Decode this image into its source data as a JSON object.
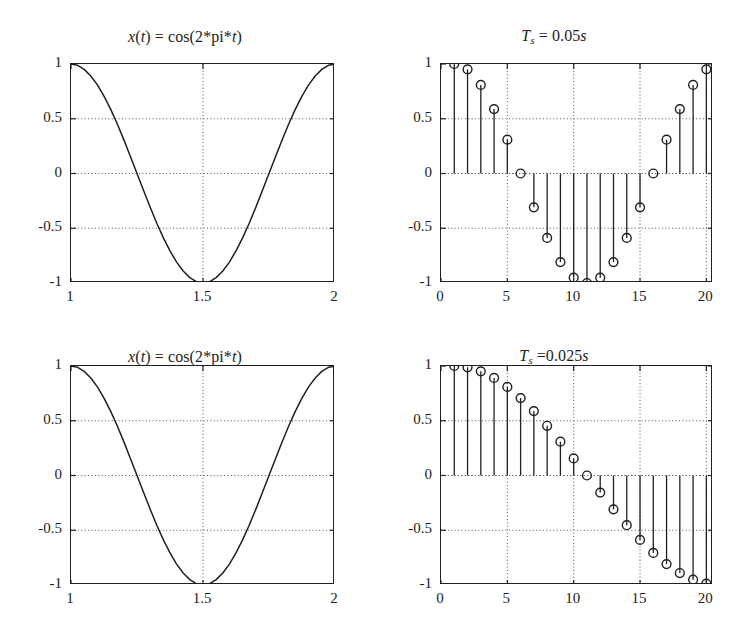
{
  "figure": {
    "background": "#ffffff",
    "ink": "#202020",
    "grid_color": "#555555",
    "panel_count": 4
  },
  "panels": [
    {
      "id": "top-left",
      "title_prefix": "x",
      "title_arg": "(t)",
      "title_rest": " = cos(2*pi*",
      "title_var": "t",
      "title_close": ")",
      "title_plain": "x(t) = cos(2*pi*t)"
    },
    {
      "id": "top-right",
      "title_main": "T",
      "title_sub": "s",
      "title_rest": " = 0.05",
      "title_unit": "s",
      "title_plain": "Ts = 0.05s"
    },
    {
      "id": "bottom-left",
      "title_plain": "x(t) = cos(2*pi*t)"
    },
    {
      "id": "bottom-right",
      "title_main": "T",
      "title_sub": "s",
      "title_rest": " =0.025",
      "title_unit": "s",
      "title_plain": "Ts =0.025s"
    }
  ],
  "chart_data": [
    {
      "panel": "top-left",
      "type": "line",
      "title": "x(t) = cos(2*pi*t)",
      "xlabel": "",
      "ylabel": "",
      "xlim": [
        1,
        2
      ],
      "ylim": [
        -1,
        1
      ],
      "xticks": [
        1,
        1.5,
        2
      ],
      "xticklabels": [
        "1",
        "1.5",
        "2"
      ],
      "yticks": [
        -1,
        -0.5,
        0,
        0.5,
        1
      ],
      "yticklabels": [
        "-1",
        "-0.5",
        "0",
        "0.5",
        "1"
      ],
      "grid": true,
      "grid_style": "dotted",
      "legend": "none",
      "series": [
        {
          "name": "cos(2*pi*t)",
          "formula": "cos(2*pi*t)",
          "x": [
            1,
            1.025,
            1.05,
            1.075,
            1.1,
            1.125,
            1.15,
            1.175,
            1.2,
            1.225,
            1.25,
            1.275,
            1.3,
            1.325,
            1.35,
            1.375,
            1.4,
            1.425,
            1.45,
            1.475,
            1.5,
            1.525,
            1.55,
            1.575,
            1.6,
            1.625,
            1.65,
            1.675,
            1.7,
            1.725,
            1.75,
            1.775,
            1.8,
            1.825,
            1.85,
            1.875,
            1.9,
            1.925,
            1.95,
            1.975,
            2
          ],
          "y": [
            1.0,
            0.988,
            0.951,
            0.891,
            0.809,
            0.707,
            0.588,
            0.454,
            0.309,
            0.156,
            0.0,
            -0.156,
            -0.309,
            -0.454,
            -0.588,
            -0.707,
            -0.809,
            -0.891,
            -0.951,
            -0.988,
            -1.0,
            -0.988,
            -0.951,
            -0.891,
            -0.809,
            -0.707,
            -0.588,
            -0.454,
            -0.309,
            -0.156,
            0.0,
            0.156,
            0.309,
            0.454,
            0.588,
            0.707,
            0.809,
            0.891,
            0.951,
            0.988,
            1.0
          ]
        }
      ]
    },
    {
      "panel": "top-right",
      "type": "stem",
      "title": "Ts = 0.05s",
      "xlabel": "",
      "ylabel": "",
      "xlim": [
        0,
        20.5
      ],
      "ylim": [
        -1,
        1
      ],
      "xticks": [
        0,
        5,
        10,
        15,
        20
      ],
      "xticklabels": [
        "0",
        "5",
        "10",
        "15",
        "20"
      ],
      "yticks": [
        -1,
        -0.5,
        0,
        0.5,
        1
      ],
      "yticklabels": [
        "-1",
        "-0.5",
        "0",
        "0.5",
        "1"
      ],
      "grid": true,
      "grid_style": "dotted",
      "legend": "none",
      "sampling_period": 0.05,
      "marker": "open-circle",
      "categories": [
        1,
        2,
        3,
        4,
        5,
        6,
        7,
        8,
        9,
        10,
        11,
        12,
        13,
        14,
        15,
        16,
        17,
        18,
        19,
        20
      ],
      "values": [
        1.0,
        0.951,
        0.809,
        0.588,
        0.309,
        0.0,
        -0.309,
        -0.588,
        -0.809,
        -0.951,
        -1.0,
        -0.951,
        -0.809,
        -0.588,
        -0.309,
        0.0,
        0.309,
        0.588,
        0.809,
        0.951
      ]
    },
    {
      "panel": "bottom-left",
      "type": "line",
      "title": "x(t) = cos(2*pi*t)",
      "xlabel": "",
      "ylabel": "",
      "xlim": [
        1,
        2
      ],
      "ylim": [
        -1,
        1
      ],
      "xticks": [
        1,
        1.5,
        2
      ],
      "xticklabels": [
        "1",
        "1.5",
        "2"
      ],
      "yticks": [
        -1,
        -0.5,
        0,
        0.5,
        1
      ],
      "yticklabels": [
        "-1",
        "-0.5",
        "0",
        "0.5",
        "1"
      ],
      "grid": true,
      "grid_style": "dotted",
      "legend": "none",
      "series": [
        {
          "name": "cos(2*pi*t)",
          "formula": "cos(2*pi*t)",
          "x": [
            1,
            1.025,
            1.05,
            1.075,
            1.1,
            1.125,
            1.15,
            1.175,
            1.2,
            1.225,
            1.25,
            1.275,
            1.3,
            1.325,
            1.35,
            1.375,
            1.4,
            1.425,
            1.45,
            1.475,
            1.5,
            1.525,
            1.55,
            1.575,
            1.6,
            1.625,
            1.65,
            1.675,
            1.7,
            1.725,
            1.75,
            1.775,
            1.8,
            1.825,
            1.85,
            1.875,
            1.9,
            1.925,
            1.95,
            1.975,
            2
          ],
          "y": [
            1.0,
            0.988,
            0.951,
            0.891,
            0.809,
            0.707,
            0.588,
            0.454,
            0.309,
            0.156,
            0.0,
            -0.156,
            -0.309,
            -0.454,
            -0.588,
            -0.707,
            -0.809,
            -0.891,
            -0.951,
            -0.988,
            -1.0,
            -0.988,
            -0.951,
            -0.891,
            -0.809,
            -0.707,
            -0.588,
            -0.454,
            -0.309,
            -0.156,
            0.0,
            0.156,
            0.309,
            0.454,
            0.588,
            0.707,
            0.809,
            0.891,
            0.951,
            0.988,
            1.0
          ]
        }
      ]
    },
    {
      "panel": "bottom-right",
      "type": "stem",
      "title": "Ts =0.025s",
      "xlabel": "",
      "ylabel": "",
      "xlim": [
        0,
        20.5
      ],
      "ylim": [
        -1,
        1
      ],
      "xticks": [
        0,
        5,
        10,
        15,
        20
      ],
      "xticklabels": [
        "0",
        "5",
        "10",
        "15",
        "20"
      ],
      "yticks": [
        -1,
        -0.5,
        0,
        0.5,
        1
      ],
      "yticklabels": [
        "-1",
        "-0.5",
        "0",
        "0.5",
        "1"
      ],
      "grid": true,
      "grid_style": "dotted",
      "legend": "none",
      "sampling_period": 0.025,
      "marker": "open-circle",
      "categories": [
        1,
        2,
        3,
        4,
        5,
        6,
        7,
        8,
        9,
        10,
        11,
        12,
        13,
        14,
        15,
        16,
        17,
        18,
        19,
        20
      ],
      "values": [
        1.0,
        0.988,
        0.951,
        0.891,
        0.809,
        0.707,
        0.588,
        0.454,
        0.309,
        0.156,
        0.0,
        -0.156,
        -0.309,
        -0.454,
        -0.588,
        -0.707,
        -0.809,
        -0.891,
        -0.951,
        -0.988
      ]
    }
  ]
}
